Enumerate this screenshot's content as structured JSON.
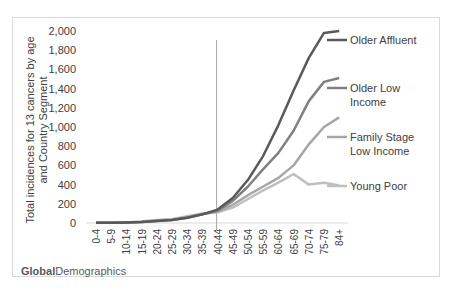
{
  "chart_data": {
    "type": "line",
    "title": "",
    "xlabel": "",
    "ylabel": "Total incidences for 13 cancers by age and Country Segment",
    "ylim": [
      0,
      2000
    ],
    "yticks": [
      "0",
      "200",
      "400",
      "600",
      "800",
      "1,000",
      "1,200",
      "1,400",
      "1,600",
      "1,800",
      "2,000"
    ],
    "grid": false,
    "legend_position": "inline-right",
    "categories": [
      "0-4",
      "5-9",
      "10-14",
      "15-19",
      "20-24",
      "25-29",
      "30-34",
      "35-39",
      "40-44",
      "45-49",
      "50-54",
      "55-59",
      "60-64",
      "65-69",
      "70-74",
      "75-79",
      "84+"
    ],
    "annotations": [
      {
        "type": "vertical-line",
        "at_category": "40-44"
      }
    ],
    "series": [
      {
        "name": "Older Affluent",
        "color": "#595959",
        "values": [
          2,
          3,
          5,
          10,
          20,
          30,
          55,
          90,
          140,
          260,
          450,
          700,
          1020,
          1380,
          1720,
          1980,
          2000
        ]
      },
      {
        "name": "Older Low Income",
        "color": "#808080",
        "values": [
          2,
          3,
          5,
          10,
          20,
          30,
          55,
          90,
          130,
          230,
          380,
          560,
          730,
          960,
          1270,
          1470,
          1510
        ]
      },
      {
        "name": "Family Stage Low Income",
        "color": "#a6a6a6",
        "values": [
          2,
          3,
          5,
          12,
          25,
          35,
          60,
          95,
          120,
          190,
          290,
          380,
          470,
          600,
          820,
          1000,
          1100
        ]
      },
      {
        "name": "Young Poor",
        "color": "#bfbfbf",
        "values": [
          2,
          3,
          6,
          15,
          30,
          40,
          70,
          100,
          110,
          160,
          250,
          340,
          420,
          510,
          400,
          420,
          390
        ]
      }
    ]
  },
  "labels": {
    "series_0_line1": "Older Affluent",
    "series_1_line1": "Older Low",
    "series_1_line2": "Income",
    "series_2_line1": "Family Stage",
    "series_2_line2": "Low Income",
    "series_3_line1": "Young Poor"
  },
  "footer": {
    "logo_bold": "Global",
    "logo_regular": "Demographics"
  }
}
